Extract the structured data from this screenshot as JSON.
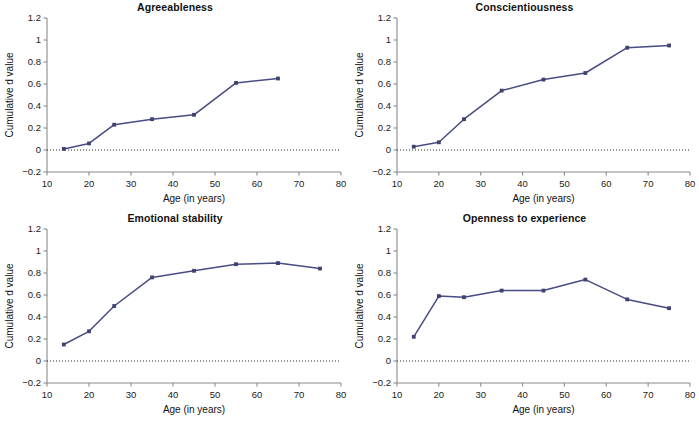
{
  "figure": {
    "width": 699,
    "height": 422,
    "layout": "2x2 panel grid",
    "line_color": "#474c82",
    "marker_color": "#3d4270",
    "axis_color": "#8a8a8a"
  },
  "axes_common": {
    "xlabel": "Age (in years)",
    "ylabel": "Cumulative d value",
    "xlim": [
      10,
      80
    ],
    "ylim": [
      -0.2,
      1.2
    ],
    "xticks": [
      10,
      20,
      30,
      40,
      50,
      60,
      70,
      80
    ],
    "xtick_labels": [
      "10",
      "20",
      "30",
      "40",
      "50",
      "60",
      "70",
      "80"
    ],
    "yticks": [
      -0.2,
      0,
      0.2,
      0.4,
      0.6,
      0.8,
      1,
      1.2
    ],
    "ytick_labels": [
      "−0.2",
      "0",
      "0.2",
      "0.4",
      "0.6",
      "0.8",
      "1",
      "1.2"
    ],
    "zero_reference_line": 0,
    "grid": false,
    "legend": "none"
  },
  "chart_data": [
    {
      "type": "line",
      "title": "Agreeableness",
      "xlabel": "Age (in years)",
      "ylabel": "Cumulative d value",
      "xlim": [
        10,
        80
      ],
      "ylim": [
        -0.2,
        1.2
      ],
      "x": [
        14,
        20,
        26,
        35,
        45,
        55,
        65
      ],
      "values": [
        0.01,
        0.06,
        0.23,
        0.28,
        0.32,
        0.61,
        0.65
      ],
      "marker": "square",
      "color": "#474c82"
    },
    {
      "type": "line",
      "title": "Conscientiousness",
      "xlabel": "Age (in years)",
      "ylabel": "Cumulative d value",
      "xlim": [
        10,
        80
      ],
      "ylim": [
        -0.2,
        1.2
      ],
      "x": [
        14,
        20,
        26,
        35,
        45,
        55,
        65,
        75
      ],
      "values": [
        0.03,
        0.07,
        0.28,
        0.54,
        0.64,
        0.7,
        0.93,
        0.95
      ],
      "marker": "square",
      "color": "#474c82"
    },
    {
      "type": "line",
      "title": "Emotional stability",
      "xlabel": "Age (in years)",
      "ylabel": "Cumulative d value",
      "xlim": [
        10,
        80
      ],
      "ylim": [
        -0.2,
        1.2
      ],
      "x": [
        14,
        20,
        26,
        35,
        45,
        55,
        65,
        75
      ],
      "values": [
        0.15,
        0.27,
        0.5,
        0.76,
        0.82,
        0.88,
        0.89,
        0.84
      ],
      "marker": "square",
      "color": "#474c82"
    },
    {
      "type": "line",
      "title": "Openness to experience",
      "xlabel": "Age (in years)",
      "ylabel": "Cumulative d value",
      "xlim": [
        10,
        80
      ],
      "ylim": [
        -0.2,
        1.2
      ],
      "x": [
        14,
        20,
        26,
        35,
        45,
        55,
        65,
        75
      ],
      "values": [
        0.22,
        0.59,
        0.58,
        0.64,
        0.64,
        0.74,
        0.56,
        0.48
      ],
      "marker": "square",
      "color": "#474c82"
    }
  ]
}
